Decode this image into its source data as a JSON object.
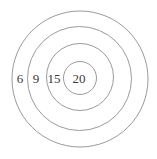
{
  "diagram": {
    "type": "concentric-target",
    "rings": [
      {
        "label": "6",
        "score": 6
      },
      {
        "label": "9",
        "score": 9
      },
      {
        "label": "15",
        "score": 15
      },
      {
        "label": "20",
        "score": 20
      }
    ],
    "colors": {
      "ring_stroke": "#9a9a9a",
      "text": "#3a3a3a",
      "background": "#ffffff"
    }
  }
}
